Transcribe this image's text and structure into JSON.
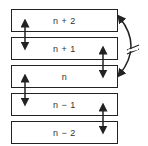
{
  "diagram": {
    "layers": [
      {
        "label": "n + 2",
        "top": 9
      },
      {
        "label": "n + 1",
        "top": 37
      },
      {
        "label": "n",
        "top": 65
      },
      {
        "label": "n − 1",
        "top": 93
      },
      {
        "label": "n − 2",
        "top": 121
      }
    ],
    "connections": [
      {
        "from": "n + 2",
        "to": "n + 1",
        "type": "double-arrow",
        "side": "left"
      },
      {
        "from": "n + 1",
        "to": "n",
        "type": "double-arrow",
        "side": "right"
      },
      {
        "from": "n",
        "to": "n − 1",
        "type": "double-arrow",
        "side": "left"
      },
      {
        "from": "n − 1",
        "to": "n − 2",
        "type": "double-arrow",
        "side": "right"
      },
      {
        "from": "n + 2",
        "to": "n",
        "type": "curved-double-arrow-broken",
        "side": "outer-right",
        "marker": "//"
      }
    ],
    "colors": {
      "stroke": "#222222",
      "text": "#333333",
      "background": "#ffffff"
    }
  }
}
